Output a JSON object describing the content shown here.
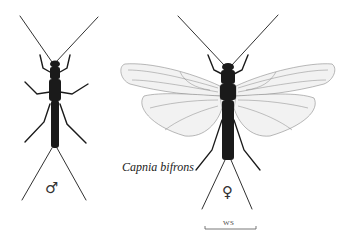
{
  "figure": {
    "species_name": "Capnia bifrons",
    "male_symbol": "♂",
    "female_symbol": "♀",
    "scale_bar_label": "WS"
  },
  "specimens": [
    {
      "sex": "male",
      "wings": false
    },
    {
      "sex": "female",
      "wings": true
    }
  ],
  "colors": {
    "body": "#1a1a1a",
    "wing_fill": "#f2f2f2",
    "wing_vein": "#7a7a7a",
    "background": "#ffffff"
  }
}
